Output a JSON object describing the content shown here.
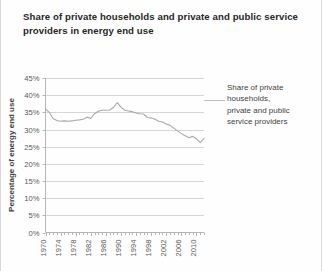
{
  "chart_data": {
    "type": "line",
    "title": "Share of private households and private and public service providers in energy end use",
    "xlabel": "",
    "ylabel": "Percentage of energy end use",
    "ylim": [
      0,
      45
    ],
    "ytick_labels": [
      "0%",
      "5%",
      "10%",
      "15%",
      "20%",
      "25%",
      "30%",
      "35%",
      "40%",
      "45%"
    ],
    "ytick_values": [
      0,
      5,
      10,
      15,
      20,
      25,
      30,
      35,
      40,
      45
    ],
    "xlim": [
      1970,
      2012
    ],
    "xtick_labels": [
      "1970",
      "1974",
      "1978",
      "1982",
      "1986",
      "1990",
      "1994",
      "1998",
      "2002",
      "2006",
      "2010"
    ],
    "xtick_values": [
      1970,
      1974,
      1978,
      1982,
      1986,
      1990,
      1994,
      1998,
      2002,
      2006,
      2010
    ],
    "minor_ticks_every": 1,
    "grid": "horizontal",
    "legend_position": "none",
    "line_color": "#a9a9a9",
    "grid_color": "#d6d6d6",
    "series": [
      {
        "name": "Share of private households, private and public service providers",
        "x": [
          1970,
          1971,
          1972,
          1973,
          1974,
          1975,
          1976,
          1977,
          1978,
          1979,
          1980,
          1981,
          1982,
          1983,
          1984,
          1985,
          1986,
          1987,
          1988,
          1989,
          1990,
          1991,
          1992,
          1993,
          1994,
          1995,
          1996,
          1997,
          1998,
          1999,
          2000,
          2001,
          2002,
          2003,
          2004,
          2005,
          2006,
          2007,
          2008,
          2009,
          2010,
          2011,
          2012
        ],
        "values": [
          36.0,
          35.0,
          33.2,
          32.6,
          32.4,
          32.5,
          32.4,
          32.5,
          32.7,
          32.8,
          33.0,
          33.6,
          33.2,
          34.6,
          35.3,
          35.6,
          35.6,
          35.7,
          36.4,
          37.8,
          36.5,
          35.6,
          35.4,
          35.2,
          34.8,
          34.6,
          34.5,
          33.5,
          33.4,
          33.0,
          32.4,
          32.2,
          31.6,
          31.2,
          30.4,
          29.6,
          28.8,
          28.2,
          27.6,
          28.0,
          27.3,
          26.2,
          27.4
        ]
      }
    ],
    "annotations": [
      {
        "text": "Share of private households, private and public service providers",
        "lines": [
          "Share of private",
          "households,",
          "private and public",
          "service providers"
        ],
        "leader_line": true
      }
    ]
  }
}
